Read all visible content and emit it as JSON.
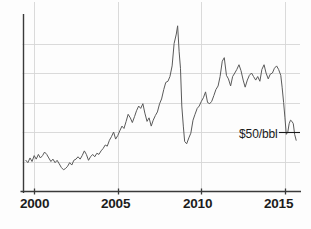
{
  "chart_data": {
    "type": "line",
    "title": "",
    "subtitle": "",
    "xlabel": "",
    "ylabel": "",
    "grid": true,
    "legend": null,
    "xlim": [
      1999.3,
      2015.9
    ],
    "ylim": [
      0,
      150
    ],
    "xticks": [
      2000,
      2005,
      2010,
      2015
    ],
    "xtick_labels": [
      "2000",
      "2005",
      "2010",
      "2015"
    ],
    "ygridlines": [
      25,
      50,
      75,
      100,
      125
    ],
    "annotations": [
      {
        "name": "price-annotation",
        "text": "$50/bbl",
        "value": 50,
        "x": 2015.4,
        "dash": "—"
      }
    ],
    "series": [
      {
        "name": "Crude oil price (USD per barrel)",
        "color": "#5a5a5a",
        "x": [
          1999.5,
          1999.62,
          1999.75,
          1999.87,
          2000.0,
          2000.12,
          2000.25,
          2000.37,
          2000.5,
          2000.62,
          2000.75,
          2000.87,
          2001.0,
          2001.12,
          2001.25,
          2001.37,
          2001.5,
          2001.62,
          2001.75,
          2001.87,
          2002.0,
          2002.12,
          2002.25,
          2002.37,
          2002.5,
          2002.62,
          2002.75,
          2002.87,
          2003.0,
          2003.12,
          2003.25,
          2003.37,
          2003.5,
          2003.62,
          2003.75,
          2003.87,
          2004.0,
          2004.12,
          2004.25,
          2004.37,
          2004.5,
          2004.62,
          2004.75,
          2004.87,
          2005.0,
          2005.12,
          2005.25,
          2005.37,
          2005.5,
          2005.62,
          2005.75,
          2005.87,
          2006.0,
          2006.12,
          2006.25,
          2006.37,
          2006.5,
          2006.62,
          2006.75,
          2006.87,
          2007.0,
          2007.12,
          2007.25,
          2007.37,
          2007.5,
          2007.62,
          2007.75,
          2007.87,
          2008.0,
          2008.12,
          2008.25,
          2008.37,
          2008.5,
          2008.58,
          2008.67,
          2008.75,
          2008.83,
          2008.92,
          2009.0,
          2009.12,
          2009.25,
          2009.37,
          2009.5,
          2009.62,
          2009.75,
          2009.87,
          2010.0,
          2010.12,
          2010.25,
          2010.37,
          2010.5,
          2010.62,
          2010.75,
          2010.87,
          2011.0,
          2011.12,
          2011.25,
          2011.37,
          2011.5,
          2011.62,
          2011.75,
          2011.87,
          2012.0,
          2012.12,
          2012.25,
          2012.37,
          2012.5,
          2012.62,
          2012.75,
          2012.87,
          2013.0,
          2013.12,
          2013.25,
          2013.37,
          2013.5,
          2013.62,
          2013.75,
          2013.87,
          2014.0,
          2014.12,
          2014.25,
          2014.37,
          2014.5,
          2014.62,
          2014.75,
          2014.83,
          2014.92,
          2015.0,
          2015.08,
          2015.17,
          2015.25,
          2015.33,
          2015.42,
          2015.5,
          2015.58,
          2015.67
        ],
        "y": [
          26,
          24,
          28,
          25,
          30,
          27,
          31,
          28,
          30,
          33,
          31,
          28,
          25,
          27,
          24,
          26,
          23,
          20,
          18,
          19,
          21,
          24,
          22,
          26,
          27,
          29,
          27,
          30,
          34,
          31,
          26,
          29,
          31,
          29,
          32,
          31,
          34,
          36,
          39,
          38,
          43,
          46,
          50,
          44,
          47,
          51,
          55,
          53,
          59,
          65,
          62,
          58,
          63,
          68,
          72,
          70,
          74,
          66,
          59,
          62,
          55,
          60,
          64,
          67,
          74,
          78,
          86,
          92,
          93,
          97,
          106,
          125,
          133,
          140,
          118,
          104,
          72,
          55,
          42,
          40,
          45,
          49,
          60,
          65,
          70,
          72,
          76,
          79,
          84,
          75,
          74,
          76,
          81,
          86,
          89,
          97,
          110,
          113,
          98,
          95,
          89,
          97,
          100,
          103,
          107,
          102,
          94,
          88,
          94,
          98,
          100,
          97,
          94,
          97,
          93,
          103,
          107,
          100,
          95,
          99,
          100,
          104,
          106,
          103,
          98,
          88,
          75,
          62,
          48,
          50,
          57,
          60,
          59,
          57,
          48,
          43
        ]
      }
    ]
  },
  "axis": {
    "xticks": [
      {
        "label": "2000",
        "value": 2000
      },
      {
        "label": "2005",
        "value": 2005
      },
      {
        "label": "2010",
        "value": 2010
      },
      {
        "label": "2015",
        "value": 2015
      }
    ]
  },
  "annotation": {
    "text": "$50/bbl",
    "dash": "—"
  },
  "colors": {
    "line": "#5a5a5a",
    "grid": "#d6d6d6",
    "axis": "#3a3a3a",
    "text": "#1c1c1c",
    "background": "#fdfdfd"
  }
}
